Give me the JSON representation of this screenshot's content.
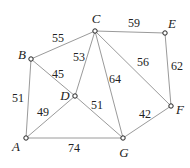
{
  "chart_data": {
    "type": "graph",
    "directed": false,
    "nodes": [
      {
        "id": "A",
        "x": 26,
        "y": 138,
        "lx": 16,
        "ly": 148
      },
      {
        "id": "B",
        "x": 31,
        "y": 59,
        "lx": 22,
        "ly": 56
      },
      {
        "id": "C",
        "x": 95,
        "y": 31,
        "lx": 96,
        "ly": 20
      },
      {
        "id": "D",
        "x": 75,
        "y": 96,
        "lx": 65,
        "ly": 97
      },
      {
        "id": "E",
        "x": 165,
        "y": 33,
        "lx": 172,
        "ly": 25
      },
      {
        "id": "F",
        "x": 171,
        "y": 106,
        "lx": 180,
        "ly": 111
      },
      {
        "id": "G",
        "x": 123,
        "y": 138,
        "lx": 124,
        "ly": 154
      }
    ],
    "edges": [
      {
        "from": "A",
        "to": "B",
        "weight": "51",
        "lx": 18,
        "ly": 99
      },
      {
        "from": "A",
        "to": "D",
        "weight": "49",
        "lx": 43,
        "ly": 113
      },
      {
        "from": "A",
        "to": "G",
        "weight": "74",
        "lx": 74,
        "ly": 149
      },
      {
        "from": "B",
        "to": "C",
        "weight": "55",
        "lx": 58,
        "ly": 39
      },
      {
        "from": "B",
        "to": "D",
        "weight": "45",
        "lx": 58,
        "ly": 75
      },
      {
        "from": "C",
        "to": "D",
        "weight": "53",
        "lx": 79,
        "ly": 58
      },
      {
        "from": "C",
        "to": "G",
        "weight": "64",
        "lx": 115,
        "ly": 80
      },
      {
        "from": "D",
        "to": "G",
        "weight": "51",
        "lx": 97,
        "ly": 106
      },
      {
        "from": "C",
        "to": "E",
        "weight": "59",
        "lx": 134,
        "ly": 24
      },
      {
        "from": "C",
        "to": "F",
        "weight": "56",
        "lx": 143,
        "ly": 63
      },
      {
        "from": "E",
        "to": "F",
        "weight": "62",
        "lx": 177,
        "ly": 67
      },
      {
        "from": "G",
        "to": "F",
        "weight": "42",
        "lx": 145,
        "ly": 115
      }
    ]
  }
}
